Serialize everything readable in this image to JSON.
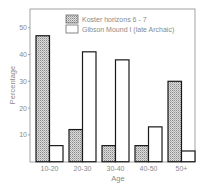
{
  "chart_data": {
    "type": "bar",
    "title": "",
    "xlabel": "Age",
    "ylabel": "Percentage",
    "categories": [
      "10-20",
      "20-30",
      "30-40",
      "40-50",
      "50+"
    ],
    "series": [
      {
        "name": "Koster horizons 6 - 7",
        "fill": "stippled",
        "values": [
          47,
          12,
          6,
          6,
          30
        ]
      },
      {
        "name": "Gibson Mound I (late Archaic)",
        "fill": "white",
        "values": [
          6,
          41,
          38,
          13,
          4
        ]
      }
    ],
    "yticks": [
      10,
      20,
      30,
      40,
      50
    ],
    "ylim": [
      0,
      56
    ],
    "grid": false,
    "legend_position": "top-right inside"
  },
  "colors": {
    "frame": "#8c8c8c",
    "bar_outline": "#1a1a1a",
    "stipple_bg": "#d9d9d9",
    "stipple_dot": "#7a7a7a",
    "text": "#8a8a8a"
  }
}
